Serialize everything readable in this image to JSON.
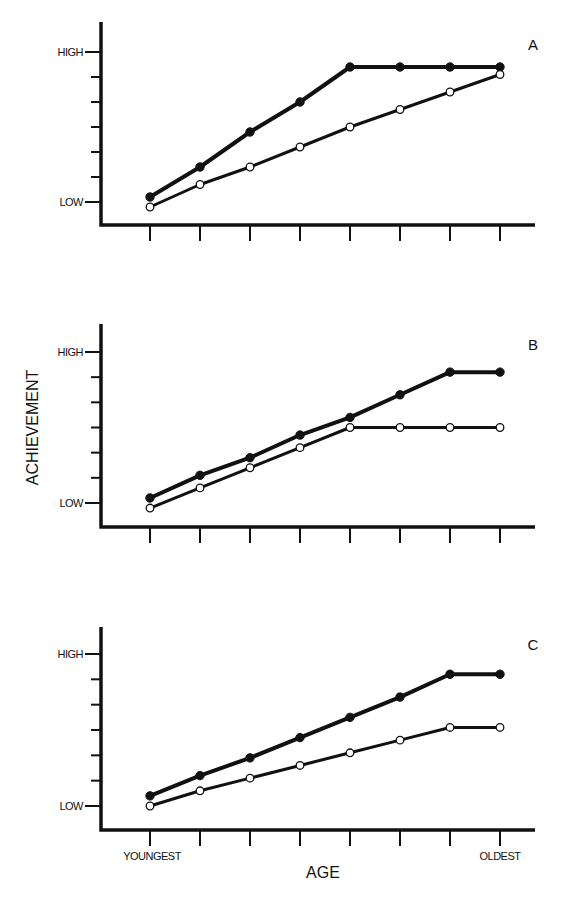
{
  "chart_data": [
    {
      "type": "line",
      "panel": "A",
      "title": "A",
      "xlabel": "",
      "ylabel": "",
      "x": [
        1,
        2,
        3,
        4,
        5,
        6,
        7,
        8
      ],
      "ytick_labels": {
        "low": "LOW",
        "high": "HIGH"
      },
      "ylim": [
        0,
        6
      ],
      "grid": false,
      "series": [
        {
          "name": "filled",
          "marker": "filled-circle",
          "values": [
            0.2,
            1.4,
            2.8,
            4.0,
            5.4,
            5.4,
            5.4,
            5.4
          ]
        },
        {
          "name": "open",
          "marker": "open-circle",
          "values": [
            -0.2,
            0.7,
            1.4,
            2.2,
            3.0,
            3.7,
            4.4,
            5.1
          ]
        }
      ]
    },
    {
      "type": "line",
      "panel": "B",
      "title": "B",
      "xlabel": "",
      "ylabel": "ACHIEVEMENT",
      "x": [
        1,
        2,
        3,
        4,
        5,
        6,
        7,
        8
      ],
      "ytick_labels": {
        "low": "LOW",
        "high": "HIGH"
      },
      "ylim": [
        0,
        6
      ],
      "grid": false,
      "series": [
        {
          "name": "filled",
          "marker": "filled-circle",
          "values": [
            0.2,
            1.1,
            1.8,
            2.7,
            3.4,
            4.3,
            5.2,
            5.2
          ]
        },
        {
          "name": "open",
          "marker": "open-circle",
          "values": [
            -0.2,
            0.6,
            1.4,
            2.2,
            3.0,
            3.0,
            3.0,
            3.0
          ]
        }
      ]
    },
    {
      "type": "line",
      "panel": "C",
      "title": "C",
      "xlabel": "AGE",
      "ylabel": "",
      "x": [
        1,
        2,
        3,
        4,
        5,
        6,
        7,
        8
      ],
      "xtick_labels": {
        "first": "YOUNGEST",
        "last": "OLDEST"
      },
      "ytick_labels": {
        "low": "LOW",
        "high": "HIGH"
      },
      "ylim": [
        0,
        6
      ],
      "grid": false,
      "series": [
        {
          "name": "filled",
          "marker": "filled-circle",
          "values": [
            0.4,
            1.2,
            1.9,
            2.7,
            3.5,
            4.3,
            5.2,
            5.2
          ]
        },
        {
          "name": "open",
          "marker": "open-circle",
          "values": [
            0.0,
            0.6,
            1.1,
            1.6,
            2.1,
            2.6,
            3.1,
            3.1
          ]
        }
      ]
    }
  ]
}
